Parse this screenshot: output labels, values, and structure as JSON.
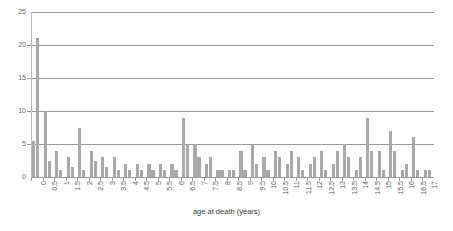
{
  "chart_data": {
    "type": "bar",
    "title": "",
    "subtitle": "",
    "xlabel": "age at death (years)",
    "ylabel": "",
    "grid": true,
    "legend": false,
    "legend_position": "none",
    "xlim": [
      0,
      17.5
    ],
    "ylim": [
      0,
      25
    ],
    "yticks": [
      0,
      5,
      10,
      15,
      20,
      25
    ],
    "categories": [
      "0",
      "0.5",
      "1",
      "1.5",
      "2",
      "2.5",
      "3",
      "3.5",
      "4",
      "4.5",
      "5",
      "5.5",
      "6",
      "6.5",
      "7",
      "7.5",
      "8",
      "8.5",
      "9",
      "9.5",
      "10",
      "10.5",
      "11",
      "11.5",
      "12",
      "12.5",
      "13",
      "13.5",
      "14",
      "14.5",
      "15",
      "15.5",
      "16",
      "16.5",
      "17"
    ],
    "values": [
      21,
      10,
      4,
      3,
      7.5,
      4,
      3,
      3,
      2,
      2,
      2,
      2,
      2,
      9,
      5,
      2,
      1,
      1,
      4,
      5,
      3,
      4,
      2,
      3,
      2,
      4,
      2,
      5,
      1,
      9,
      4,
      7,
      1,
      6,
      1
    ],
    "bar_color": "#a9a9a9",
    "bar_groups": [
      {
        "category": "0",
        "bars": [
          5.5,
          21
        ]
      },
      {
        "category": "0.5",
        "bars": [
          10,
          2.5
        ]
      },
      {
        "category": "1",
        "bars": [
          4,
          1
        ]
      },
      {
        "category": "1.5",
        "bars": [
          3,
          1.5
        ]
      },
      {
        "category": "2",
        "bars": [
          7.5,
          1
        ]
      },
      {
        "category": "2.5",
        "bars": [
          4,
          2.5
        ]
      },
      {
        "category": "3",
        "bars": [
          3,
          1.5
        ]
      },
      {
        "category": "3.5",
        "bars": [
          3,
          1
        ]
      },
      {
        "category": "4",
        "bars": [
          2,
          1
        ]
      },
      {
        "category": "4.5",
        "bars": [
          2,
          1
        ]
      },
      {
        "category": "5",
        "bars": [
          2,
          1
        ]
      },
      {
        "category": "5.5",
        "bars": [
          2,
          1
        ]
      },
      {
        "category": "6",
        "bars": [
          2,
          1
        ]
      },
      {
        "category": "6.5",
        "bars": [
          9,
          5
        ]
      },
      {
        "category": "7",
        "bars": [
          5,
          3
        ]
      },
      {
        "category": "7.5",
        "bars": [
          2,
          3
        ]
      },
      {
        "category": "8",
        "bars": [
          1,
          1
        ]
      },
      {
        "category": "8.5",
        "bars": [
          1,
          1
        ]
      },
      {
        "category": "9",
        "bars": [
          4,
          1
        ]
      },
      {
        "category": "9.5",
        "bars": [
          5,
          2
        ]
      },
      {
        "category": "10",
        "bars": [
          3,
          1
        ]
      },
      {
        "category": "10.5",
        "bars": [
          4,
          3
        ]
      },
      {
        "category": "11",
        "bars": [
          2,
          4
        ]
      },
      {
        "category": "11.5",
        "bars": [
          3,
          1
        ]
      },
      {
        "category": "12",
        "bars": [
          2,
          3
        ]
      },
      {
        "category": "12.5",
        "bars": [
          4,
          1
        ]
      },
      {
        "category": "13",
        "bars": [
          2,
          4
        ]
      },
      {
        "category": "13.5",
        "bars": [
          5,
          3
        ]
      },
      {
        "category": "14",
        "bars": [
          1,
          3
        ]
      },
      {
        "category": "14.5",
        "bars": [
          9,
          4
        ]
      },
      {
        "category": "15",
        "bars": [
          4,
          1
        ]
      },
      {
        "category": "15.5",
        "bars": [
          7,
          4
        ]
      },
      {
        "category": "16",
        "bars": [
          1,
          2
        ]
      },
      {
        "category": "16.5",
        "bars": [
          6,
          1
        ]
      },
      {
        "category": "17",
        "bars": [
          1,
          1
        ]
      }
    ]
  },
  "axis": {
    "x_title": "age at death (years)"
  }
}
